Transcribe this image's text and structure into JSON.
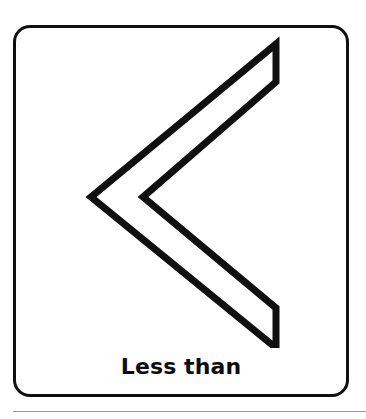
{
  "card": {
    "caption": "Less than",
    "symbol_name": "less-than-chevron",
    "symbol_glyph": "<",
    "border_color": "#101010",
    "background_color": "#ffffff",
    "stroke_color": "#101010"
  },
  "separator": {
    "color": "#9b9b9b"
  }
}
